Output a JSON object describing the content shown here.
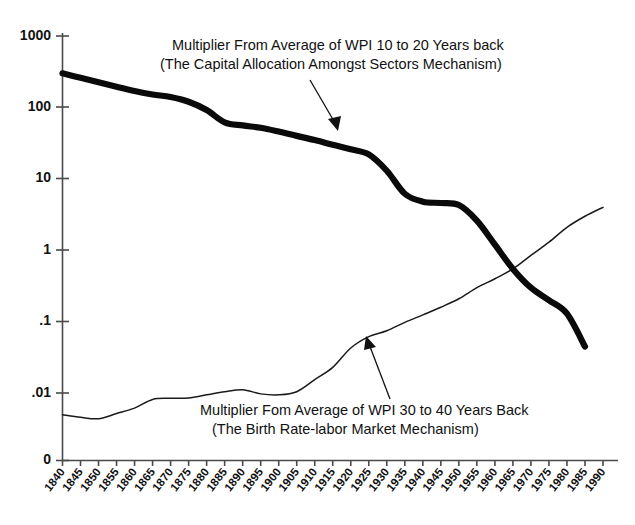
{
  "chart_data": {
    "type": "line",
    "title": "",
    "subtitle": "",
    "xlabel": "",
    "ylabel": "",
    "yscale": "log",
    "ylim": [
      0.0018,
      1000
    ],
    "xlim": [
      1840,
      1990
    ],
    "grid": false,
    "legend_position": "none",
    "y_tick_labels": [
      "1000",
      "100",
      "10",
      "1",
      ".1",
      ".01",
      "0"
    ],
    "y_tick_values": [
      1000,
      100,
      10,
      1,
      0.1,
      0.01,
      0
    ],
    "x_tick_labels": [
      "1840",
      "1845",
      "1850",
      "1855",
      "1860",
      "1865",
      "1870",
      "1875",
      "1880",
      "1885",
      "1890",
      "1895",
      "1900",
      "1905",
      "1910",
      "1915",
      "1920",
      "1925",
      "1930",
      "1935",
      "1940",
      "1945",
      "1950",
      "1955",
      "1960",
      "1965",
      "1970",
      "1975",
      "1980",
      "1985",
      "1990"
    ],
    "x": [
      1840,
      1845,
      1850,
      1855,
      1860,
      1865,
      1870,
      1875,
      1880,
      1885,
      1890,
      1895,
      1900,
      1905,
      1910,
      1915,
      1920,
      1925,
      1930,
      1935,
      1940,
      1945,
      1950,
      1955,
      1960,
      1965,
      1970,
      1975,
      1980,
      1985,
      1990
    ],
    "series": [
      {
        "name": "Multiplier From Average of WPI 10 to 20 Years back",
        "style": "thick",
        "color": "#0a0a0a",
        "values": [
          300,
          260,
          225,
          195,
          170,
          152,
          140,
          120,
          92,
          62,
          56,
          52,
          46,
          40,
          35,
          30,
          26,
          22,
          13,
          6.2,
          4.8,
          4.6,
          4.3,
          2.6,
          1.2,
          0.55,
          0.3,
          0.2,
          0.13,
          0.045,
          null
        ]
      },
      {
        "name": "Multiplier Fom Average of WPI 30 to 40 Years Back",
        "style": "thin",
        "color": "#1a1a1a",
        "values": [
          0.005,
          0.0046,
          0.0044,
          0.0052,
          0.0062,
          0.0082,
          0.0085,
          0.0086,
          0.0095,
          0.0105,
          0.0112,
          0.0098,
          0.0095,
          0.0105,
          0.0155,
          0.023,
          0.043,
          0.062,
          0.075,
          0.098,
          0.125,
          0.16,
          0.21,
          0.3,
          0.4,
          0.55,
          0.85,
          1.3,
          2.1,
          3.0,
          4.0
        ]
      }
    ],
    "annotations": [
      {
        "id": "top-annotation",
        "lines": [
          "Multiplier From Average of WPI 10 to 20 Years back",
          "(The Capital Allocation Amongst Sectors Mechanism)"
        ],
        "arrow_from": [
          1896,
          140
        ],
        "arrow_to": [
          1912,
          36
        ]
      },
      {
        "id": "bottom-annotation",
        "lines": [
          "Multiplier Fom Average of WPI 30 to 40 Years Back",
          "(The Birth Rate-labor Market Mechanism)"
        ],
        "arrow_from": [
          1936,
          0.072
        ],
        "arrow_to": [
          1927,
          0.135
        ]
      }
    ]
  },
  "caption": {
    "text": ""
  }
}
